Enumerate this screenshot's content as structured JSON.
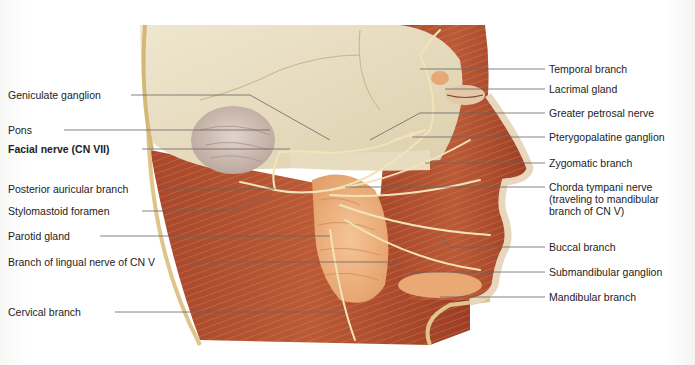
{
  "figure": {
    "colors": {
      "bone": "#e8dfc6",
      "muscle": "#b5502f",
      "muscle_dark": "#8e3220",
      "nerve": "#f1e3b5",
      "gland": "#eeb27d",
      "skin": "#e6d3b0",
      "leader_line": "#555555",
      "text": "#222222"
    },
    "left_labels": [
      {
        "id": "geniculate-ganglion",
        "text": "Geniculate ganglion",
        "y": 95,
        "bold": false
      },
      {
        "id": "pons",
        "text": "Pons",
        "y": 130,
        "bold": false
      },
      {
        "id": "facial-nerve",
        "text": "Facial nerve (CN VII)",
        "y": 149,
        "bold": true
      },
      {
        "id": "posterior-auricular-branch",
        "text": "Posterior auricular branch",
        "y": 189,
        "bold": false
      },
      {
        "id": "stylomastoid-foramen",
        "text": "Stylomastoid foramen",
        "y": 211,
        "bold": false
      },
      {
        "id": "parotid-gland",
        "text": "Parotid gland",
        "y": 236,
        "bold": false
      },
      {
        "id": "lingual-branch",
        "text": "Branch of lingual nerve of CN V",
        "y": 262,
        "bold": false
      },
      {
        "id": "cervical-branch",
        "text": "Cervical branch",
        "y": 312,
        "bold": false
      }
    ],
    "right_labels": [
      {
        "id": "temporal-branch",
        "text": "Temporal branch",
        "y": 69
      },
      {
        "id": "lacrimal-gland",
        "text": "Lacrimal gland",
        "y": 89
      },
      {
        "id": "greater-petrosal-nerve",
        "text": "Greater petrosal nerve",
        "y": 113
      },
      {
        "id": "pterygopalatine-ganglion",
        "text": "Pterygopalatine ganglion",
        "y": 137
      },
      {
        "id": "zygomatic-branch",
        "text": "Zygomatic branch",
        "y": 163
      },
      {
        "id": "chorda-tympani-nerve",
        "text": "Chorda tympani nerve (traveling to mandibular branch of CN V)",
        "y": 187
      },
      {
        "id": "buccal-branch",
        "text": "Buccal branch",
        "y": 247
      },
      {
        "id": "submandibular-ganglion",
        "text": "Submandibular ganglion",
        "y": 272
      },
      {
        "id": "mandibular-branch",
        "text": "Mandibular branch",
        "y": 297
      }
    ]
  }
}
